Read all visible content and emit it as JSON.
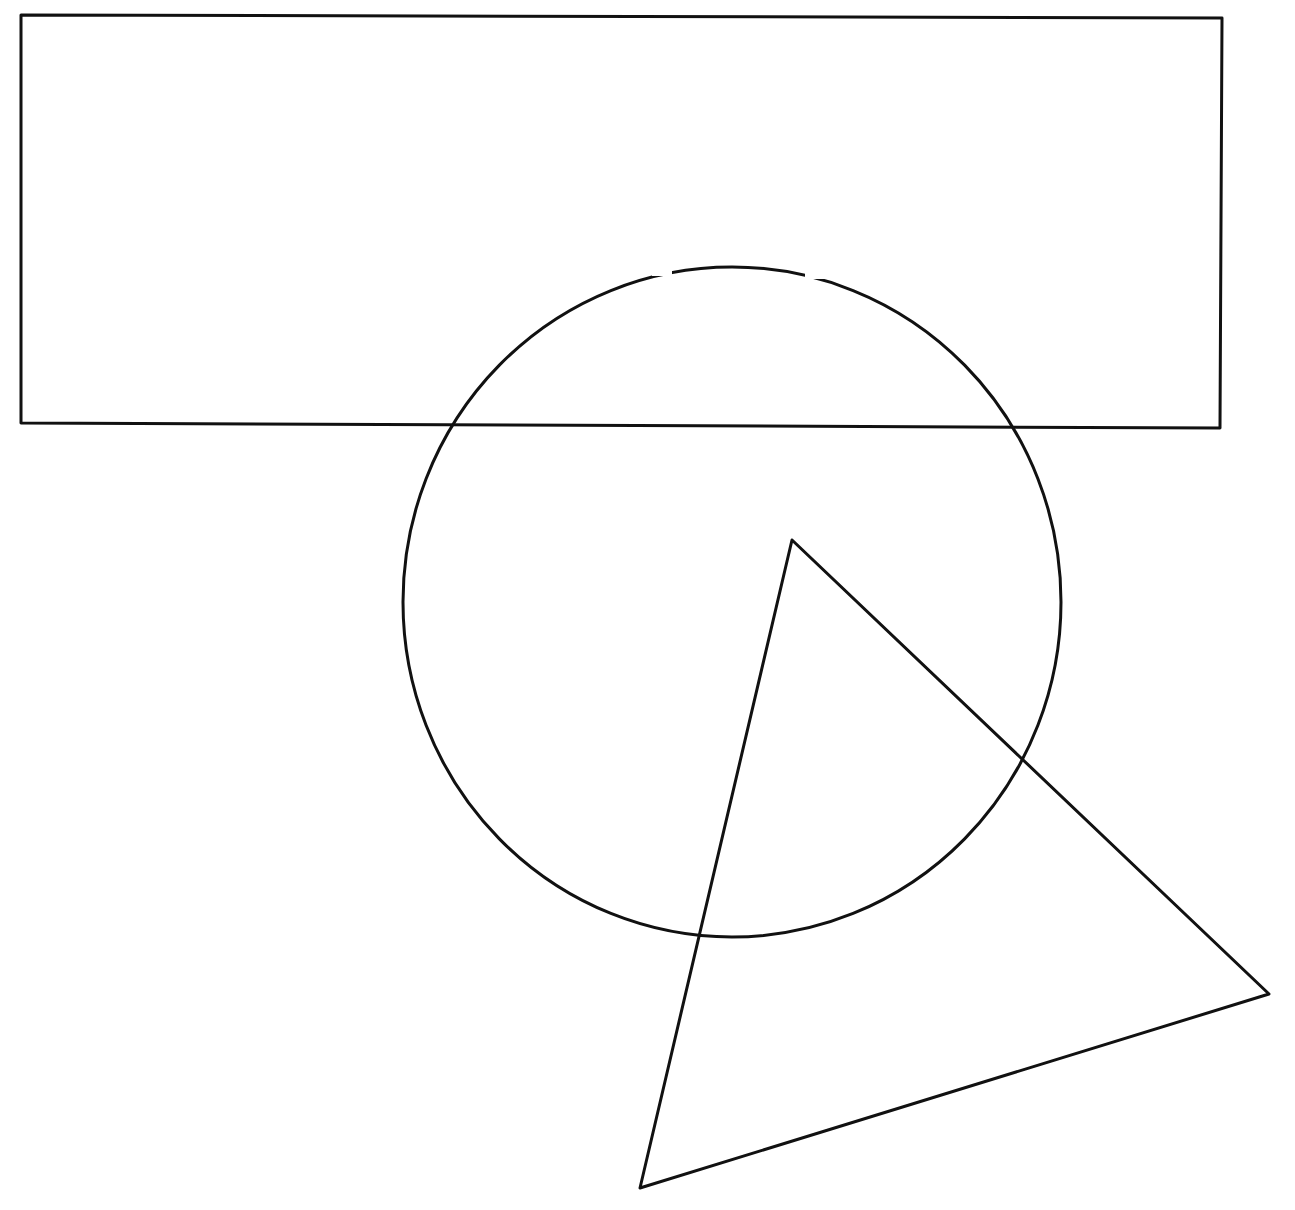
{
  "diagram": {
    "title": "",
    "stroke_color": "#111111",
    "background_color": "#ffffff",
    "stroke_width": 3,
    "shapes": {
      "rectangle": {
        "label": "rectangle",
        "points": "21,15 1222,18 1220,428 21,423"
      },
      "circle": {
        "label": "circle",
        "cx": 732,
        "cy": 602,
        "rx": 329,
        "ry": 335
      },
      "triangle": {
        "label": "triangle",
        "points": "792,540 1269,994 640,1188"
      }
    }
  }
}
